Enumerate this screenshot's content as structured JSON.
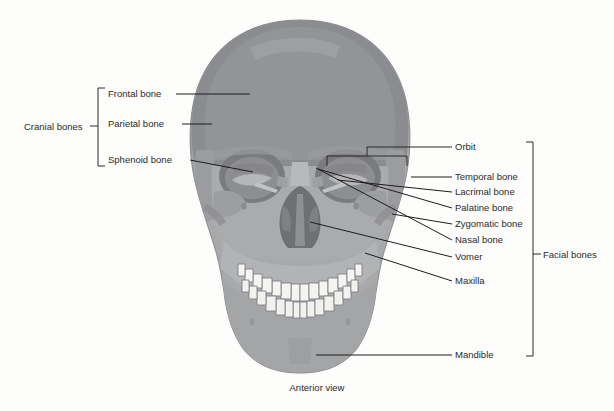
{
  "figure": {
    "caption": "Anterior view",
    "background_color": "#fdfdfc",
    "text_color": "#2a2a2a",
    "leader_color": "#1d1d1d"
  },
  "groups": {
    "cranial": {
      "label": "Cranial bones",
      "bracket": {
        "x": 98,
        "y_top": 88,
        "y_bottom": 166,
        "tick_y": 126
      },
      "label_x": 24,
      "label_y": 130
    },
    "facial": {
      "label": "Facial bones",
      "bracket": {
        "x": 533,
        "y_top": 142,
        "y_bottom": 356,
        "tick_y": 254
      },
      "label_x": 543,
      "label_y": 258
    }
  },
  "labels_left": [
    {
      "name": "frontal-bone",
      "text": "Frontal bone",
      "x": 108,
      "y": 97,
      "line": [
        [
          176,
          94
        ],
        [
          250,
          94
        ]
      ]
    },
    {
      "name": "parietal-bone",
      "text": "Parietal bone",
      "x": 108,
      "y": 127,
      "line": [
        [
          182,
          124
        ],
        [
          212,
          124
        ]
      ]
    },
    {
      "name": "sphenoid-bone",
      "text": "Sphenoid bone",
      "x": 108,
      "y": 163,
      "line": [
        [
          190,
          160
        ],
        [
          253,
          172
        ]
      ]
    }
  ],
  "labels_right": [
    {
      "name": "orbit",
      "text": "Orbit",
      "x": 455,
      "y": 150,
      "line": [
        [
          417,
          147
        ],
        [
          452,
          147
        ]
      ]
    },
    {
      "name": "temporal-bone",
      "text": "Temporal bone",
      "x": 455,
      "y": 180,
      "line": [
        [
          411,
          177
        ],
        [
          452,
          177
        ]
      ]
    },
    {
      "name": "lacrimal-bone",
      "text": "Lacrimal bone",
      "x": 455,
      "y": 195,
      "line": [
        [
          338,
          180
        ],
        [
          452,
          192
        ]
      ]
    },
    {
      "name": "palatine-bone",
      "text": "Palatine bone",
      "x": 455,
      "y": 211,
      "line": [
        [
          318,
          169
        ],
        [
          452,
          208
        ]
      ]
    },
    {
      "name": "zygomatic-bone",
      "text": "Zygomatic bone",
      "x": 455,
      "y": 227,
      "line": [
        [
          392,
          214
        ],
        [
          452,
          224
        ]
      ]
    },
    {
      "name": "nasal-bone",
      "text": "Nasal bone",
      "x": 455,
      "y": 243,
      "line": [
        [
          316,
          168
        ],
        [
          452,
          240
        ]
      ]
    },
    {
      "name": "vomer",
      "text": "Vomer",
      "x": 455,
      "y": 260,
      "line": [
        [
          310,
          222
        ],
        [
          452,
          257
        ]
      ]
    },
    {
      "name": "maxilla",
      "text": "Maxilla",
      "x": 455,
      "y": 284,
      "line": [
        [
          365,
          253
        ],
        [
          452,
          281
        ]
      ]
    }
  ],
  "labels_bottom": [
    {
      "name": "mandible",
      "text": "Mandible",
      "x": 455,
      "y": 358,
      "line": [
        [
          316,
          355
        ],
        [
          452,
          355
        ]
      ]
    }
  ],
  "orbit_bracket": {
    "x_left": 327,
    "x_right": 407,
    "y_top": 156,
    "y_bottom": 166,
    "stem_x": 367,
    "stem_y": 147
  },
  "skull": {
    "cranium_color": "#8f9093",
    "frontal_color": "#96979a",
    "parietal_color": "#8a8b8e",
    "face_color": "#a8a9ab",
    "maxilla_color": "#b3b4b6",
    "mandible_color": "#a3a4a6",
    "orbit_dark": "#77787b",
    "nasal_dark": "#6f7073",
    "zygomatic_color": "#9b9c9e",
    "teeth_color": "#f4f3ef",
    "teeth_outline": "#74757a",
    "outline_color": "#7d7e81"
  }
}
